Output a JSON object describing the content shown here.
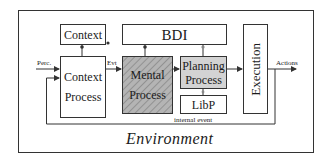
{
  "diagram": {
    "environment": {
      "label": "Environment"
    },
    "boxes": {
      "context": {
        "label": "Context"
      },
      "bdi": {
        "label": "BDI"
      },
      "context_process": {
        "line1": "Context",
        "line2": "Process"
      },
      "mental_process": {
        "line1": "Mental",
        "line2": "Process"
      },
      "planning_process": {
        "line1": "Planning",
        "line2": "Process"
      },
      "libp": {
        "label": "LibP"
      },
      "execution": {
        "label": "Execution"
      }
    },
    "edges": {
      "perception": "Perc.",
      "event": "Evt",
      "actions": "Actions",
      "internal_event": "internal event"
    },
    "colors": {
      "stroke": "#333333",
      "mental_fill": "#b0b0b0",
      "planning_fill": "#d3d3d3"
    }
  }
}
